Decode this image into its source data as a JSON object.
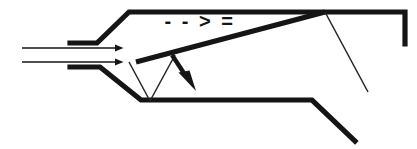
{
  "figure": {
    "background_color": "#ffffff",
    "line_color": "#151515",
    "thin_line_color": "#252525",
    "width": 417,
    "height": 149
  },
  "annotation": {
    "text": "- - > =",
    "x": 200,
    "y": 23,
    "font_size": 20,
    "color": "#151515"
  },
  "inflow_arrows": {
    "count": 2,
    "direction": "right",
    "color": "#151515",
    "arrows": [
      {
        "x1": 22,
        "y1": 48,
        "x2": 128,
        "y2": 48
      },
      {
        "x1": 22,
        "y1": 62,
        "x2": 128,
        "y2": 62
      }
    ]
  },
  "deflection_arrow": {
    "direction": "down-right",
    "color": "#151515",
    "x1": 172,
    "y1": 55,
    "x2": 194,
    "y2": 89
  },
  "walls": {
    "upper_inlet_lip": "M 70,43 L 97,43 L 129,12 L 405,12 L 405,44",
    "lower_inlet_lip": "M 70,67 L 100,67 L 141,100 L 312,100 L 355,141"
  },
  "shock_lines": {
    "oblique_shock": "M 136,62 L 325,12",
    "reflected_shock": "M 325,12 L 368,92",
    "wedge_left": "M 129,62 L 150,101",
    "wedge_right": "M 150,101 L 175,55"
  },
  "colors": {
    "stroke": "#151515",
    "thin_stroke": "#252525",
    "background": "#ffffff"
  }
}
